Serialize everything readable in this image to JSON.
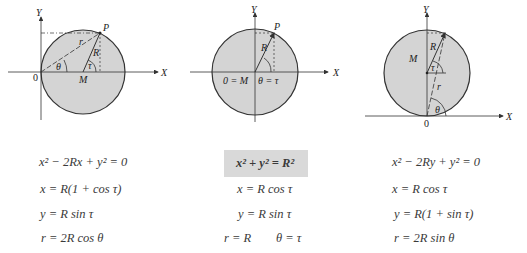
{
  "colors": {
    "circle_fill": "#d4d4d4",
    "stroke": "#333333",
    "box_fill": "#d9d9d9"
  },
  "diagrams": [
    {
      "id": "left",
      "axis_x": "X",
      "axis_y": "Y",
      "origin": "0",
      "center": "M",
      "point": "P",
      "radius_label": "R",
      "polar_label": "r",
      "angle_theta": "θ",
      "angle_tau": "τ",
      "equations": [
        "x² − 2Rx + y² = 0",
        "x = R(1 + cos τ)",
        "y = R sin τ",
        "r = 2R cos θ"
      ]
    },
    {
      "id": "middle",
      "axis_x": "X",
      "axis_y": "Y",
      "point": "P",
      "radius_label": "R",
      "center_label": "0 = M",
      "angle_label": "θ = τ",
      "equations": [
        "x² + y² = R²",
        "x = R cos τ",
        "y = R sin τ",
        "r = R",
        "θ = τ"
      ]
    },
    {
      "id": "right",
      "axis_x": "X",
      "axis_y": "Y",
      "origin": "0",
      "center": "M",
      "radius_label": "R",
      "polar_label": "r",
      "angle_theta": "θ",
      "angle_tau": "τ",
      "equations": [
        "x² − 2Ry + y² = 0",
        "x = R cos τ",
        "y = R(1 + sin τ)",
        "r = 2R sin θ"
      ]
    }
  ]
}
